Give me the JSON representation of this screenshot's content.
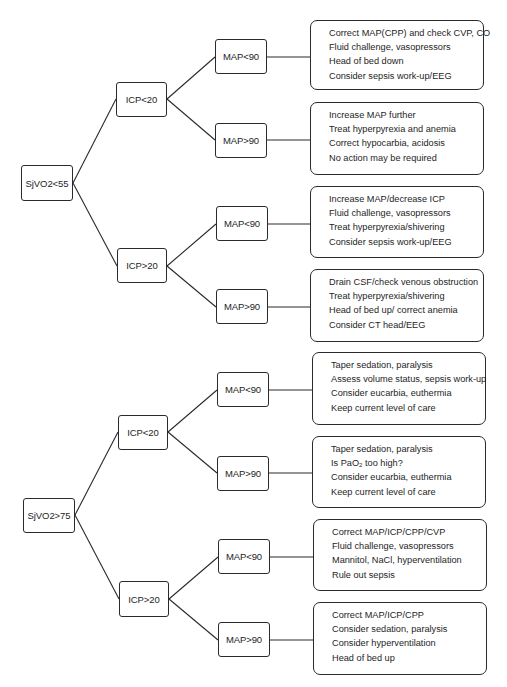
{
  "diagram": {
    "type": "decision-tree",
    "trees": [
      {
        "root": "SjVO2<55",
        "branches": [
          {
            "label": "ICP<20",
            "children": [
              {
                "label": "MAP<90",
                "actions": [
                  "Correct MAP(CPP) and check CVP, CO",
                  "Fluid challenge, vasopressors",
                  "Head of bed down",
                  "Consider sepsis work-up/EEG"
                ]
              },
              {
                "label": "MAP>90",
                "actions": [
                  "Increase MAP further",
                  "Treat hyperpyrexia and anemia",
                  "Correct hypocarbia, acidosis",
                  "No action may be required"
                ]
              }
            ]
          },
          {
            "label": "ICP>20",
            "children": [
              {
                "label": "MAP<90",
                "actions": [
                  "Increase MAP/decrease ICP",
                  "Fluid challenge, vasopressors",
                  "Treat hyperpyrexia/shivering",
                  "Consider sepsis work-up/EEG"
                ]
              },
              {
                "label": "MAP>90",
                "actions": [
                  "Drain CSF/check venous obstruction",
                  "Treat hyperpyrexia/shivering",
                  "Head of bed up/ correct anemia",
                  "Consider CT head/EEG"
                ]
              }
            ]
          }
        ]
      },
      {
        "root": "SjVO2>75",
        "branches": [
          {
            "label": "ICP<20",
            "children": [
              {
                "label": "MAP<90",
                "actions": [
                  "Taper sedation, paralysis",
                  "Assess volume status, sepsis work-up",
                  "Consider eucarbia, euthermia",
                  "Keep current level of care"
                ]
              },
              {
                "label": "MAP>90",
                "actions": [
                  "Taper sedation, paralysis",
                  "Is PaO2 too high?",
                  "Consider eucarbia, euthermia",
                  "Keep current level of care"
                ]
              }
            ]
          },
          {
            "label": "ICP>20",
            "children": [
              {
                "label": "MAP<90",
                "actions": [
                  "Correct MAP/ICP/CPP/CVP",
                  "Fluid challenge, vasopressors",
                  "Mannitol, NaCl, hyperventilation",
                  "Rule out sepsis"
                ]
              },
              {
                "label": "MAP>90",
                "actions": [
                  "Correct MAP/ICP/CPP",
                  "Consider sedation, paralysis",
                  "Consider hyperventilation",
                  "Head of bed up"
                ]
              }
            ]
          }
        ]
      }
    ],
    "pao2_parts": {
      "pre": "Is PaO",
      "sub": "2",
      "post": " too high?"
    },
    "colors": {
      "line": "#2a2a2a",
      "text": "#1e1e1e",
      "background": "#ffffff"
    }
  }
}
